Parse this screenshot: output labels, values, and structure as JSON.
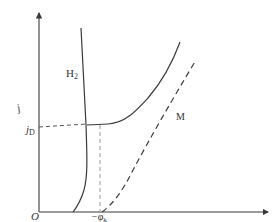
{
  "diagram": {
    "type": "polarization-curve",
    "axes": {
      "y_label": "j",
      "origin_label": "O"
    },
    "curves": [
      {
        "id": "h2",
        "label": "H",
        "label_sub": "2",
        "style": "solid"
      },
      {
        "id": "metal",
        "label": "M",
        "style": "dashed"
      },
      {
        "id": "total",
        "label": "",
        "style": "solid"
      }
    ],
    "markers": {
      "jd_label": "j",
      "jd_sub": "D",
      "phi_label": "−φ",
      "phi_sub": "k"
    },
    "colors": {
      "line": "#3a3a3a",
      "dashed_guide": "#9a9a9a"
    }
  }
}
